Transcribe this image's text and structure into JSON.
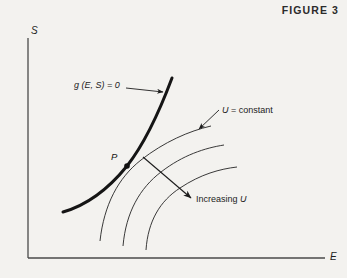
{
  "figure": {
    "title": "FIGURE 3",
    "axes": {
      "y_label": "S",
      "x_label": "E",
      "origin": [
        28,
        258
      ],
      "y_top": [
        28,
        38
      ],
      "x_right": [
        325,
        258
      ],
      "color": "#4a4a4a"
    },
    "point": {
      "label": "P",
      "x": 127,
      "y": 166,
      "radius": 2.6,
      "color": "#111111"
    },
    "labels": {
      "constraint": "g (E, S) = 0",
      "isoline": "U = constant",
      "isoline_symbol": "U",
      "isoline_rest": " = constant",
      "direction": "Increasing U",
      "direction_text": "Increasing ",
      "direction_symbol": "U"
    },
    "curves": {
      "constraint_curve": {
        "name": "g (E, S) = 0",
        "style": "thick",
        "width": 3.0,
        "color": "#151515",
        "path": "M 63 212 C 84 206, 106 192, 127 166 C 145 143, 160 110, 172 78"
      },
      "utility_curves": [
        {
          "name": "U-curve-1",
          "width": 0.9,
          "color": "#242424",
          "path": "M 100 241 C 104 205, 118 178, 141 160 C 164 142, 189 131, 211 126"
        },
        {
          "name": "U-curve-2",
          "width": 0.9,
          "color": "#242424",
          "path": "M 123 246 C 126 212, 140 188, 161 172 C 183 155, 205 148, 224 145"
        },
        {
          "name": "U-curve-3",
          "width": 0.9,
          "color": "#242424",
          "path": "M 146 250 C 148 221, 160 201, 180 188 C 201 174, 220 169, 237 167"
        }
      ]
    },
    "annotations": {
      "constraint_leader": {
        "name": "constraint-leader-arrow",
        "from": [
          126,
          88
        ],
        "to": [
          164,
          92
        ],
        "color": "#1c1c1c"
      },
      "isoline_leader": {
        "name": "isoline-leader-arrow",
        "from": [
          219,
          110
        ],
        "to": [
          198,
          130
        ],
        "color": "#1c1c1c"
      },
      "direction_arrow": {
        "name": "increasing-u-arrow",
        "from": [
          143,
          157
        ],
        "to": [
          192,
          199
        ],
        "color": "#1c1c1c"
      }
    },
    "colors": {
      "background": "#f3f2ef",
      "ink": "#1c1c1c",
      "axis": "#4a4a4a"
    }
  }
}
